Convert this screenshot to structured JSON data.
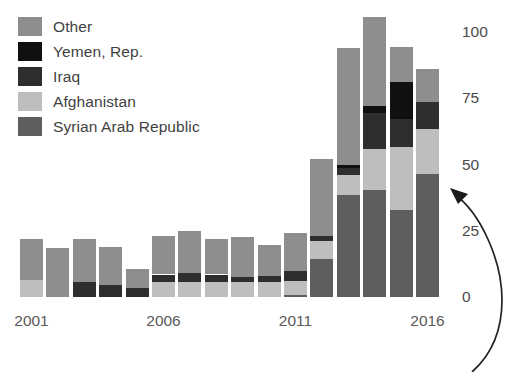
{
  "chart_data": {
    "type": "bar",
    "stacked": true,
    "title": "",
    "subtitle": "",
    "xlabel": "",
    "ylabel": "",
    "grid": false,
    "legend_position": "top-left",
    "y_axis_position": "right",
    "ylim": [
      0,
      110
    ],
    "yticks": [
      0,
      25,
      50,
      75,
      100
    ],
    "ytick_labels": [
      "0",
      "25",
      "50",
      "75",
      "100"
    ],
    "categories": [
      "2001",
      "2002",
      "2003",
      "2004",
      "2005",
      "2006",
      "2007",
      "2008",
      "2009",
      "2010",
      "2011",
      "2012",
      "2013",
      "2014",
      "2015",
      "2016"
    ],
    "xtick_labels": [
      "2001",
      "2006",
      "2011",
      "2016"
    ],
    "xtick_categories": [
      "2001",
      "2006",
      "2011",
      "2016"
    ],
    "series": [
      {
        "name": "Syrian Arab Republic",
        "color": "#5e5e5e",
        "values": [
          0,
          0,
          0,
          0,
          0,
          0,
          0,
          0,
          0,
          0,
          0.7,
          14.5,
          38.5,
          40.5,
          33,
          46.5
        ]
      },
      {
        "name": "Afghanistan",
        "color": "#bebebe",
        "values": [
          6.5,
          0,
          0,
          0,
          0,
          5.5,
          5.5,
          5.5,
          5.5,
          5.5,
          5.5,
          6.5,
          7.5,
          15.5,
          23.5,
          17
        ]
      },
      {
        "name": "Iraq",
        "color": "#2e2e2e",
        "values": [
          0,
          0,
          5.5,
          4.5,
          3.5,
          3,
          3.5,
          3,
          2,
          2.5,
          3.5,
          2,
          2.5,
          13.5,
          10.5,
          10
        ]
      },
      {
        "name": "Yemen, Rep.",
        "color": "#101010",
        "values": [
          0,
          0,
          0,
          0,
          0,
          0,
          0,
          0,
          0,
          0,
          0,
          0,
          1.5,
          2.5,
          14,
          0
        ]
      },
      {
        "name": "Other",
        "color": "#8e8e8e",
        "values": [
          15.5,
          18.5,
          16.5,
          14.5,
          7,
          14.5,
          16,
          13.5,
          15,
          11.5,
          14.5,
          29,
          44,
          33.5,
          13.5,
          12.5
        ]
      }
    ],
    "totals": [
      22,
      18.5,
      22,
      19,
      10.5,
      23,
      25,
      22,
      22.5,
      19.5,
      24.2,
      52,
      94,
      105.5,
      94.5,
      86
    ]
  },
  "legend": {
    "items": [
      {
        "label": "Other",
        "color": "#8e8e8e"
      },
      {
        "label": "Yemen, Rep.",
        "color": "#101010"
      },
      {
        "label": "Iraq",
        "color": "#2e2e2e"
      },
      {
        "label": "Afghanistan",
        "color": "#bebebe"
      },
      {
        "label": "Syrian Arab Republic",
        "color": "#5e5e5e"
      }
    ]
  },
  "annotation": {
    "name": "curved-arrow",
    "direction": "up-left",
    "color": "#222222"
  }
}
